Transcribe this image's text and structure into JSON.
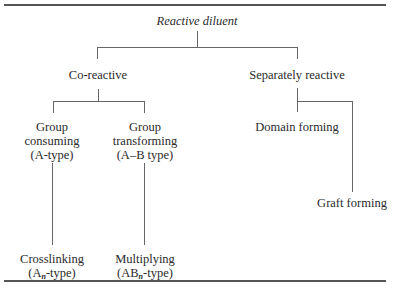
{
  "header_fragment": "…ing by reactive diluents…",
  "diagram": {
    "root": "Reactive diluent",
    "level1": [
      {
        "label": "Co-reactive"
      },
      {
        "label": "Separately reactive"
      }
    ],
    "co_reactive_children": [
      {
        "line1": "Group",
        "line2": "consuming",
        "line3": "(A-type)"
      },
      {
        "line1": "Group",
        "line2": "transforming",
        "line3": "(A–B type)"
      }
    ],
    "separately_reactive_children": [
      {
        "label": "Domain forming"
      },
      {
        "label": "Graft forming"
      }
    ],
    "leaves": [
      {
        "line1": "Crosslinking",
        "line2_prefix": "(A",
        "line2_sub": "n",
        "line2_suffix": "-type)"
      },
      {
        "line1": "Multiplying",
        "line2_prefix": "(AB",
        "line2_sub": "n",
        "line2_suffix": "-type)"
      }
    ]
  },
  "colors": {
    "line": "#666666",
    "rule": "#555555",
    "text": "#2a2a2a"
  }
}
